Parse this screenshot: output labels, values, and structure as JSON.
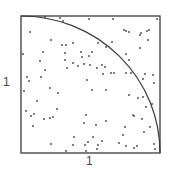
{
  "diagram": {
    "x_label": "1",
    "y_label": "1",
    "colors": {
      "frame": "#3a3a3a",
      "arc": "#3a3a3a",
      "points": "#444444",
      "background": "#ffffff"
    },
    "square": {
      "x": 21,
      "y": 16,
      "width": 139,
      "height": 137
    },
    "quarter_circle": {
      "center_corner": "bottom-left",
      "radius": "side length",
      "from": "top-left",
      "to": "bottom-right"
    }
  },
  "chart_data": {
    "type": "scatter",
    "title": "",
    "xlabel": "1",
    "ylabel": "1",
    "xlim": [
      0,
      1
    ],
    "ylim": [
      0,
      1
    ],
    "grid": false,
    "annotations": [
      "quarter circle arc of radius 1 centered at origin"
    ],
    "points_px": [
      [
        45,
        17
      ],
      [
        60,
        18
      ],
      [
        89,
        19
      ],
      [
        113,
        19
      ],
      [
        157,
        19
      ],
      [
        63,
        21
      ],
      [
        124,
        30
      ],
      [
        126,
        31
      ],
      [
        129,
        32
      ],
      [
        30,
        32
      ],
      [
        147,
        31
      ],
      [
        141,
        33
      ],
      [
        140,
        35
      ],
      [
        149,
        30
      ],
      [
        51,
        40
      ],
      [
        148,
        40
      ],
      [
        98,
        43
      ],
      [
        62,
        45
      ],
      [
        66,
        45
      ],
      [
        73,
        43
      ],
      [
        112,
        42
      ],
      [
        140,
        48
      ],
      [
        106,
        47
      ],
      [
        23,
        54
      ],
      [
        43,
        52
      ],
      [
        65,
        53
      ],
      [
        81,
        52
      ],
      [
        92,
        52
      ],
      [
        82,
        57
      ],
      [
        89,
        56
      ],
      [
        126,
        54
      ],
      [
        84,
        64
      ],
      [
        129,
        60
      ],
      [
        40,
        61
      ],
      [
        65,
        60
      ],
      [
        73,
        63
      ],
      [
        67,
        68
      ],
      [
        78,
        66
      ],
      [
        90,
        65
      ],
      [
        102,
        65
      ],
      [
        97,
        68
      ],
      [
        105,
        67
      ],
      [
        45,
        70
      ],
      [
        111,
        73
      ],
      [
        114,
        73
      ],
      [
        126,
        73
      ],
      [
        131,
        73
      ],
      [
        145,
        74
      ],
      [
        153,
        75
      ],
      [
        103,
        74
      ],
      [
        27,
        77
      ],
      [
        41,
        77
      ],
      [
        29,
        81
      ],
      [
        87,
        80
      ],
      [
        143,
        79
      ],
      [
        154,
        83
      ],
      [
        24,
        91
      ],
      [
        50,
        88
      ],
      [
        58,
        93
      ],
      [
        92,
        90
      ],
      [
        106,
        90
      ],
      [
        129,
        95
      ],
      [
        143,
        97
      ],
      [
        138,
        98
      ],
      [
        37,
        101
      ],
      [
        152,
        104
      ],
      [
        146,
        107
      ],
      [
        26,
        111
      ],
      [
        31,
        116
      ],
      [
        34,
        114
      ],
      [
        57,
        109
      ],
      [
        44,
        119
      ],
      [
        50,
        118
      ],
      [
        53,
        117
      ],
      [
        86,
        115
      ],
      [
        84,
        123
      ],
      [
        96,
        125
      ],
      [
        106,
        121
      ],
      [
        133,
        115
      ],
      [
        142,
        119
      ],
      [
        134,
        116
      ],
      [
        33,
        126
      ],
      [
        125,
        127
      ],
      [
        150,
        127
      ],
      [
        123,
        135
      ],
      [
        144,
        132
      ],
      [
        74,
        137
      ],
      [
        93,
        137
      ],
      [
        51,
        144
      ],
      [
        73,
        145
      ],
      [
        85,
        145
      ],
      [
        98,
        145
      ],
      [
        102,
        141
      ],
      [
        88,
        142
      ],
      [
        119,
        143
      ],
      [
        126,
        146
      ],
      [
        134,
        148
      ],
      [
        137,
        146
      ],
      [
        97,
        149
      ],
      [
        66,
        151
      ],
      [
        86,
        151
      ],
      [
        154,
        144
      ],
      [
        155,
        149
      ]
    ]
  }
}
